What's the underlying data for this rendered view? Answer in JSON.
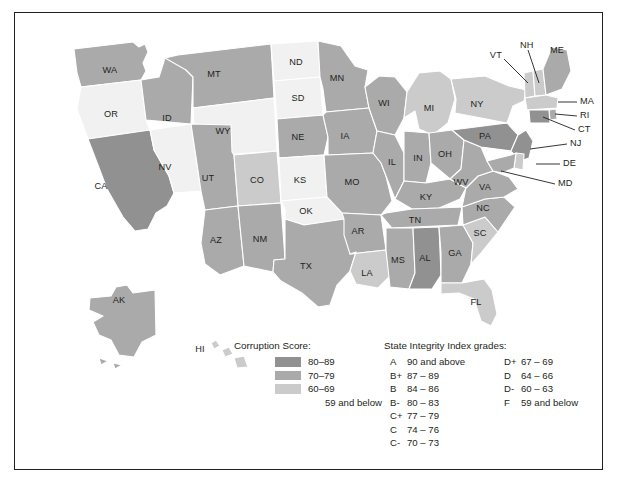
{
  "figure": {
    "type": "choropleth-map",
    "region": "United States"
  },
  "legend": {
    "score_title": "Corruption Score:",
    "grades_title": "State Integrity Index grades:",
    "score_bins": [
      {
        "label": "80–89",
        "color": "#919191",
        "min": 80,
        "max": 89
      },
      {
        "label": "70–79",
        "color": "#aaaaaa",
        "min": 70,
        "max": 79
      },
      {
        "label": "60–69",
        "color": "#cbcbcb",
        "min": 60,
        "max": 69
      },
      {
        "label": "59 and below",
        "color": "#f1f1f1",
        "min": 0,
        "max": 59
      }
    ],
    "grades_col1": [
      {
        "key": "A",
        "range": "90 and above"
      },
      {
        "key": "B+",
        "range": "87 – 89"
      },
      {
        "key": "B",
        "range": "84 – 86"
      },
      {
        "key": "B-",
        "range": "80 – 83"
      },
      {
        "key": "C+",
        "range": "77 – 79"
      },
      {
        "key": "C",
        "range": "74 – 76"
      },
      {
        "key": "C-",
        "range": "70 – 73"
      }
    ],
    "grades_col2": [
      {
        "key": "D+",
        "range": "67 – 69"
      },
      {
        "key": "D",
        "range": "64 – 66"
      },
      {
        "key": "D-",
        "range": "60 – 63"
      },
      {
        "key": "F",
        "range": "59 and below"
      }
    ]
  },
  "chart_data": {
    "type": "heatmap",
    "title": "",
    "legend_position": "bottom-center",
    "categories": [
      "80–89",
      "70–79",
      "60–69",
      "59 and below"
    ],
    "states": [
      {
        "code": "WA",
        "bin": "70–79"
      },
      {
        "code": "OR",
        "bin": "59 and below"
      },
      {
        "code": "CA",
        "bin": "80–89"
      },
      {
        "code": "NV",
        "bin": "59 and below"
      },
      {
        "code": "ID",
        "bin": "70–79"
      },
      {
        "code": "MT",
        "bin": "70–79"
      },
      {
        "code": "WY",
        "bin": "59 and below"
      },
      {
        "code": "UT",
        "bin": "70–79"
      },
      {
        "code": "CO",
        "bin": "60–69"
      },
      {
        "code": "AZ",
        "bin": "70–79"
      },
      {
        "code": "NM",
        "bin": "70–79"
      },
      {
        "code": "ND",
        "bin": "59 and below"
      },
      {
        "code": "SD",
        "bin": "59 and below"
      },
      {
        "code": "NE",
        "bin": "70–79"
      },
      {
        "code": "KS",
        "bin": "59 and below"
      },
      {
        "code": "OK",
        "bin": "59 and below"
      },
      {
        "code": "TX",
        "bin": "70–79"
      },
      {
        "code": "MN",
        "bin": "70–79"
      },
      {
        "code": "IA",
        "bin": "70–79"
      },
      {
        "code": "MO",
        "bin": "70–79"
      },
      {
        "code": "AR",
        "bin": "70–79"
      },
      {
        "code": "LA",
        "bin": "60–69"
      },
      {
        "code": "WI",
        "bin": "70–79"
      },
      {
        "code": "IL",
        "bin": "70–79"
      },
      {
        "code": "MS",
        "bin": "70–79"
      },
      {
        "code": "MI",
        "bin": "60–69"
      },
      {
        "code": "IN",
        "bin": "70–79"
      },
      {
        "code": "KY",
        "bin": "70–79"
      },
      {
        "code": "TN",
        "bin": "70–79"
      },
      {
        "code": "AL",
        "bin": "80–89"
      },
      {
        "code": "OH",
        "bin": "70–79"
      },
      {
        "code": "WV",
        "bin": "70–79"
      },
      {
        "code": "GA",
        "bin": "70–79"
      },
      {
        "code": "FL",
        "bin": "60–69"
      },
      {
        "code": "SC",
        "bin": "60–69"
      },
      {
        "code": "NC",
        "bin": "70–79"
      },
      {
        "code": "VA",
        "bin": "70–79"
      },
      {
        "code": "PA",
        "bin": "80–89"
      },
      {
        "code": "NY",
        "bin": "60–69"
      },
      {
        "code": "VT",
        "bin": "60–69"
      },
      {
        "code": "NH",
        "bin": "60–69"
      },
      {
        "code": "ME",
        "bin": "70–79"
      },
      {
        "code": "MA",
        "bin": "60–69"
      },
      {
        "code": "RI",
        "bin": "70–79"
      },
      {
        "code": "CT",
        "bin": "80–89"
      },
      {
        "code": "NJ",
        "bin": "80–89"
      },
      {
        "code": "DE",
        "bin": "60–69"
      },
      {
        "code": "MD",
        "bin": "70–79"
      },
      {
        "code": "AK",
        "bin": "70–79"
      },
      {
        "code": "HI",
        "bin": "60–69"
      }
    ],
    "callout_states": [
      "VT",
      "NH",
      "ME",
      "MA",
      "RI",
      "CT",
      "NJ",
      "DE",
      "MD"
    ]
  }
}
